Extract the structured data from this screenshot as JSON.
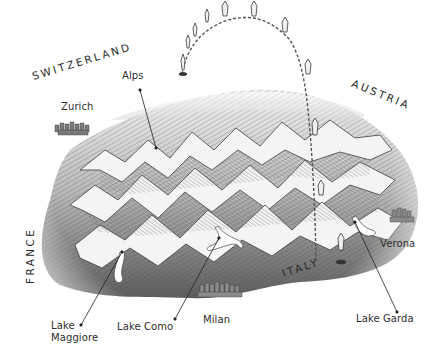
{
  "map": {
    "style": "hand-drawn relief illustration",
    "colors": {
      "ink": "#2e2e2e",
      "terrain_shadow": "#5a5a5a",
      "terrain_mid": "#9a9a9a",
      "terrain_light": "#e6e6e6",
      "background": "#ffffff"
    },
    "countries": [
      {
        "id": "switzerland",
        "label": "SWITZERLAND"
      },
      {
        "id": "austria",
        "label": "AUSTRIA"
      },
      {
        "id": "france",
        "label": "FRANCE"
      },
      {
        "id": "italy",
        "label": "ITALY"
      }
    ],
    "places": [
      {
        "id": "alps",
        "label": "Alps"
      },
      {
        "id": "zurich",
        "label": "Zurich"
      },
      {
        "id": "verona",
        "label": "Verona"
      },
      {
        "id": "lake_garda",
        "label": "Lake Garda"
      },
      {
        "id": "lake_maggiore_1",
        "label": "Lake"
      },
      {
        "id": "lake_maggiore_2",
        "label": "Maggiore"
      },
      {
        "id": "lake_como",
        "label": "Lake Como"
      },
      {
        "id": "milan",
        "label": "Milan"
      }
    ],
    "route": {
      "type": "dashed arc with balloon/pin markers",
      "marker_count": 10
    }
  }
}
